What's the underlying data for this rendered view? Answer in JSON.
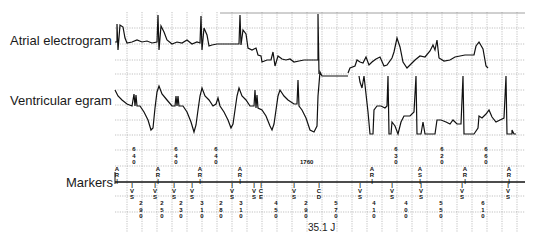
{
  "channels": {
    "atrial_label": "Atrial electrogram",
    "ventricular_label": "Ventricular egram",
    "markers_label": "Markers"
  },
  "annotations": {
    "energy": "35.1 J",
    "long_interval": "1760"
  },
  "markers_above": [
    {
      "x": 117,
      "label": "AR"
    },
    {
      "x": 158,
      "label": "AR"
    },
    {
      "x": 200,
      "label": "AR"
    },
    {
      "x": 240,
      "label": "AR"
    },
    {
      "x": 372,
      "label": "AR"
    },
    {
      "x": 420,
      "label": "AS"
    },
    {
      "x": 465,
      "label": "AR"
    },
    {
      "x": 509,
      "label": "AR"
    }
  ],
  "markers_below": [
    {
      "x": 132,
      "label": "VS"
    },
    {
      "x": 155,
      "label": "VS"
    },
    {
      "x": 174,
      "label": "VS"
    },
    {
      "x": 192,
      "label": "VS"
    },
    {
      "x": 232,
      "label": "VS"
    },
    {
      "x": 254,
      "label": "VS"
    },
    {
      "x": 261,
      "label": "CE"
    },
    {
      "x": 294,
      "label": "VS"
    },
    {
      "x": 319,
      "label": "CD"
    },
    {
      "x": 360,
      "label": "VS"
    },
    {
      "x": 392,
      "label": "VS"
    },
    {
      "x": 421,
      "label": "VS"
    },
    {
      "x": 462,
      "label": "VS"
    },
    {
      "x": 508,
      "label": "VS"
    }
  ],
  "atrial_intervals": [
    {
      "x": 134,
      "value": "640"
    },
    {
      "x": 176,
      "value": "640"
    },
    {
      "x": 216,
      "value": "640"
    },
    {
      "x": 396,
      "value": "630"
    },
    {
      "x": 442,
      "value": "620"
    },
    {
      "x": 486,
      "value": "660"
    }
  ],
  "ventricular_intervals": [
    {
      "x": 141,
      "value": "290"
    },
    {
      "x": 162,
      "value": "250"
    },
    {
      "x": 181,
      "value": "230"
    },
    {
      "x": 202,
      "value": "310"
    },
    {
      "x": 221,
      "value": "280"
    },
    {
      "x": 241,
      "value": "310"
    },
    {
      "x": 276,
      "value": "450"
    },
    {
      "x": 306,
      "value": "290"
    },
    {
      "x": 336,
      "value": "570"
    },
    {
      "x": 374,
      "value": "410"
    },
    {
      "x": 406,
      "value": "400"
    },
    {
      "x": 441,
      "value": "550"
    },
    {
      "x": 483,
      "value": "610"
    }
  ]
}
